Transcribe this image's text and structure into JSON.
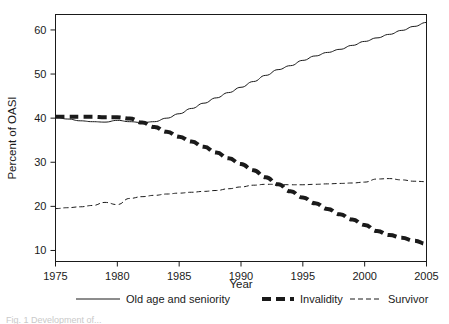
{
  "figure": {
    "background_color": "#ffffff",
    "ink_color": "#1a1a1a",
    "caption_fragment": "Fig. 1  Development of..."
  },
  "chart_data": {
    "type": "line",
    "title": "",
    "subtitle": "",
    "xlabel": "Year",
    "ylabel": "Percent of OASI",
    "xlim": [
      1975,
      2005
    ],
    "ylim": [
      7.5,
      63.5
    ],
    "xticks": [
      1975,
      1980,
      1985,
      1990,
      1995,
      2000,
      2005
    ],
    "xtick_labels": [
      "1975",
      "1980",
      "1985",
      "1990",
      "1995",
      "2000",
      "2005"
    ],
    "yticks": [
      10,
      20,
      30,
      40,
      50,
      60
    ],
    "ytick_labels": [
      "10",
      "20",
      "30",
      "40",
      "50",
      "60"
    ],
    "grid": false,
    "legend_position": "below-axes",
    "x": [
      1975,
      1976,
      1977,
      1978,
      1979,
      1980,
      1981,
      1982,
      1983,
      1984,
      1985,
      1986,
      1987,
      1988,
      1989,
      1990,
      1991,
      1992,
      1993,
      1994,
      1995,
      1996,
      1997,
      1998,
      1999,
      2000,
      2001,
      2002,
      2003,
      2004,
      2005
    ],
    "series": [
      {
        "name": "Old age and seniority",
        "line_style": "solid",
        "line_width": 1,
        "color": "#1a1a1a",
        "values": [
          40.2,
          39.8,
          39.4,
          39.2,
          39.1,
          39.5,
          39.2,
          39.0,
          39.2,
          40.0,
          41.0,
          42.2,
          43.4,
          44.6,
          45.8,
          47.0,
          48.3,
          49.7,
          51.0,
          51.9,
          53.1,
          54.1,
          54.9,
          55.6,
          56.5,
          57.4,
          58.2,
          59.0,
          59.9,
          60.8,
          61.7
        ]
      },
      {
        "name": "Invalidity",
        "line_style": "dashed-thick",
        "line_width": 4,
        "color": "#1a1a1a",
        "values": [
          40.3,
          40.3,
          40.3,
          40.3,
          40.2,
          40.2,
          39.9,
          39.0,
          38.0,
          36.9,
          35.8,
          34.7,
          33.5,
          32.2,
          30.9,
          29.6,
          28.2,
          26.6,
          25.0,
          23.4,
          22.0,
          20.7,
          19.4,
          18.2,
          17.0,
          15.8,
          14.4,
          13.5,
          12.9,
          12.2,
          11.5
        ]
      },
      {
        "name": "Survivor",
        "line_style": "dashed-thin",
        "line_width": 1,
        "color": "#1a1a1a",
        "values": [
          19.5,
          19.7,
          19.9,
          20.2,
          20.9,
          20.4,
          21.8,
          22.2,
          22.5,
          22.8,
          23.0,
          23.2,
          23.4,
          23.6,
          24.0,
          24.4,
          24.8,
          25.0,
          25.0,
          24.9,
          24.9,
          25.0,
          25.1,
          25.2,
          25.3,
          25.5,
          26.2,
          26.3,
          26.0,
          25.7,
          25.6
        ]
      }
    ],
    "annotations": []
  },
  "legend": {
    "items": [
      {
        "label": "Old age and seniority",
        "style": "solid"
      },
      {
        "label": "Invalidity",
        "style": "dashed-thick"
      },
      {
        "label": "Survivor",
        "style": "dashed-thin"
      }
    ]
  }
}
